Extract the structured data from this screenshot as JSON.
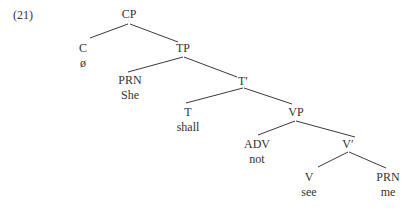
{
  "example_number": "(21)",
  "tree": {
    "nodes": {
      "cp": {
        "label": "CP"
      },
      "c": {
        "label": "C",
        "word": "ø"
      },
      "tp": {
        "label": "TP"
      },
      "prn_subj": {
        "label": "PRN",
        "word": "She"
      },
      "t_bar": {
        "label": "T′"
      },
      "t": {
        "label": "T",
        "word": "shall"
      },
      "vp": {
        "label": "VP"
      },
      "adv": {
        "label": "ADV",
        "word": "not"
      },
      "v_bar": {
        "label": "V′"
      },
      "v": {
        "label": "V",
        "word": "see"
      },
      "prn_obj": {
        "label": "PRN",
        "word": "me"
      }
    },
    "edges": [
      [
        "CP",
        "C"
      ],
      [
        "CP",
        "TP"
      ],
      [
        "TP",
        "PRN"
      ],
      [
        "TP",
        "T′"
      ],
      [
        "T′",
        "T"
      ],
      [
        "T′",
        "VP"
      ],
      [
        "VP",
        "ADV"
      ],
      [
        "VP",
        "V′"
      ],
      [
        "V′",
        "V"
      ],
      [
        "V′",
        "PRN"
      ]
    ]
  }
}
